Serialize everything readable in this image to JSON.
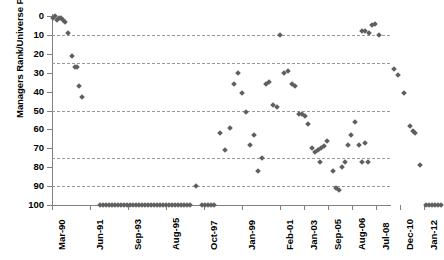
{
  "chart_data": {
    "type": "scatter",
    "title": "",
    "xlabel": "",
    "ylabel": "Managers Rank/Universe Percentile",
    "ylim": [
      0,
      100
    ],
    "y_inverted": true,
    "grid": true,
    "gridlines_y": [
      10,
      25,
      50,
      75,
      90
    ],
    "legend": null,
    "marker": "diamond",
    "marker_color": "#5f5f5f",
    "yticks": [
      0,
      10,
      20,
      30,
      40,
      50,
      60,
      70,
      80,
      90,
      100
    ],
    "ytick_labels": [
      "0",
      "10",
      "20",
      "30",
      "40",
      "50",
      "60",
      "70",
      "80",
      "90",
      "100"
    ],
    "xtick_labels": [
      "Mar-90",
      "Jun-91",
      "Sep-93",
      "Aug-95",
      "Oct-97",
      "Jan-99",
      "Feb-01",
      "Jan-03",
      "Sep-05",
      "Aug-06",
      "Jul-08",
      "Dec-10",
      "Jan-12"
    ],
    "xtick_positions": [
      0,
      38,
      76,
      114,
      152,
      190,
      228,
      252,
      276,
      300,
      324,
      348,
      372
    ],
    "points": [
      {
        "x": 1,
        "y": 1
      },
      {
        "x": 3,
        "y": 0
      },
      {
        "x": 5,
        "y": 2
      },
      {
        "x": 7,
        "y": 1
      },
      {
        "x": 9,
        "y": 1
      },
      {
        "x": 11,
        "y": 2
      },
      {
        "x": 13,
        "y": 3
      },
      {
        "x": 16,
        "y": 9
      },
      {
        "x": 20,
        "y": 21
      },
      {
        "x": 23,
        "y": 27
      },
      {
        "x": 25,
        "y": 27
      },
      {
        "x": 27,
        "y": 37
      },
      {
        "x": 30,
        "y": 43
      },
      {
        "x": 48,
        "y": 100
      },
      {
        "x": 51,
        "y": 100
      },
      {
        "x": 54,
        "y": 100
      },
      {
        "x": 57,
        "y": 100
      },
      {
        "x": 60,
        "y": 100
      },
      {
        "x": 63,
        "y": 100
      },
      {
        "x": 66,
        "y": 100
      },
      {
        "x": 69,
        "y": 100
      },
      {
        "x": 72,
        "y": 100
      },
      {
        "x": 75,
        "y": 100
      },
      {
        "x": 78,
        "y": 100
      },
      {
        "x": 81,
        "y": 100
      },
      {
        "x": 84,
        "y": 100
      },
      {
        "x": 87,
        "y": 100
      },
      {
        "x": 90,
        "y": 100
      },
      {
        "x": 93,
        "y": 100
      },
      {
        "x": 96,
        "y": 100
      },
      {
        "x": 99,
        "y": 100
      },
      {
        "x": 102,
        "y": 100
      },
      {
        "x": 105,
        "y": 100
      },
      {
        "x": 108,
        "y": 100
      },
      {
        "x": 111,
        "y": 100
      },
      {
        "x": 114,
        "y": 100
      },
      {
        "x": 117,
        "y": 100
      },
      {
        "x": 120,
        "y": 100
      },
      {
        "x": 123,
        "y": 100
      },
      {
        "x": 126,
        "y": 100
      },
      {
        "x": 129,
        "y": 100
      },
      {
        "x": 132,
        "y": 100
      },
      {
        "x": 135,
        "y": 100
      },
      {
        "x": 138,
        "y": 100
      },
      {
        "x": 144,
        "y": 90
      },
      {
        "x": 150,
        "y": 100
      },
      {
        "x": 153,
        "y": 100
      },
      {
        "x": 156,
        "y": 100
      },
      {
        "x": 159,
        "y": 100
      },
      {
        "x": 162,
        "y": 100
      },
      {
        "x": 168,
        "y": 62
      },
      {
        "x": 173,
        "y": 71
      },
      {
        "x": 178,
        "y": 59
      },
      {
        "x": 182,
        "y": 36
      },
      {
        "x": 186,
        "y": 30
      },
      {
        "x": 190,
        "y": 41
      },
      {
        "x": 194,
        "y": 51
      },
      {
        "x": 198,
        "y": 68
      },
      {
        "x": 202,
        "y": 63
      },
      {
        "x": 206,
        "y": 82
      },
      {
        "x": 210,
        "y": 75
      },
      {
        "x": 214,
        "y": 36
      },
      {
        "x": 217,
        "y": 35
      },
      {
        "x": 221,
        "y": 47
      },
      {
        "x": 225,
        "y": 48
      },
      {
        "x": 228,
        "y": 10
      },
      {
        "x": 232,
        "y": 30
      },
      {
        "x": 236,
        "y": 29
      },
      {
        "x": 240,
        "y": 36
      },
      {
        "x": 243,
        "y": 37
      },
      {
        "x": 247,
        "y": 52
      },
      {
        "x": 250,
        "y": 52
      },
      {
        "x": 253,
        "y": 53
      },
      {
        "x": 256,
        "y": 57
      },
      {
        "x": 260,
        "y": 70
      },
      {
        "x": 263,
        "y": 72
      },
      {
        "x": 266,
        "y": 71
      },
      {
        "x": 269,
        "y": 70
      },
      {
        "x": 272,
        "y": 69
      },
      {
        "x": 275,
        "y": 66
      },
      {
        "x": 268,
        "y": 77
      },
      {
        "x": 281,
        "y": 82
      },
      {
        "x": 284,
        "y": 91
      },
      {
        "x": 287,
        "y": 92
      },
      {
        "x": 290,
        "y": 80
      },
      {
        "x": 293,
        "y": 77
      },
      {
        "x": 296,
        "y": 68
      },
      {
        "x": 299,
        "y": 63
      },
      {
        "x": 303,
        "y": 56
      },
      {
        "x": 307,
        "y": 68
      },
      {
        "x": 310,
        "y": 77
      },
      {
        "x": 313,
        "y": 67
      },
      {
        "x": 316,
        "y": 77
      },
      {
        "x": 310,
        "y": 8
      },
      {
        "x": 313,
        "y": 8
      },
      {
        "x": 317,
        "y": 9
      },
      {
        "x": 320,
        "y": 5
      },
      {
        "x": 323,
        "y": 4
      },
      {
        "x": 327,
        "y": 10
      },
      {
        "x": 342,
        "y": 28
      },
      {
        "x": 346,
        "y": 31
      },
      {
        "x": 352,
        "y": 41
      },
      {
        "x": 358,
        "y": 58
      },
      {
        "x": 361,
        "y": 61
      },
      {
        "x": 363,
        "y": 62
      },
      {
        "x": 368,
        "y": 79
      },
      {
        "x": 374,
        "y": 100
      },
      {
        "x": 377,
        "y": 100
      },
      {
        "x": 380,
        "y": 100
      },
      {
        "x": 383,
        "y": 100
      },
      {
        "x": 386,
        "y": 100
      },
      {
        "x": 389,
        "y": 100
      }
    ]
  }
}
